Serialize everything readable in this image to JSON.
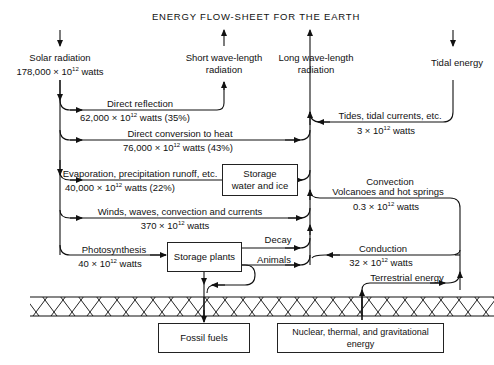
{
  "title": "ENERGY FLOW-SHEET FOR THE EARTH",
  "sources": {
    "solar": {
      "label": "Solar radiation",
      "value": "178,000 × 10",
      "exp": "12",
      "unit": " watts"
    },
    "tidal": {
      "label": "Tidal energy"
    },
    "terrestrial": {
      "label": "Terrestrial energy"
    }
  },
  "sinks": {
    "short_wave": {
      "line1": "Short wave-length",
      "line2": "radiation"
    },
    "long_wave": {
      "line1": "Long wave-length",
      "line2": "radiation"
    }
  },
  "flows": [
    {
      "id": "direct-reflection",
      "label": "Direct reflection",
      "value": "62,000 × 10",
      "exp": "12",
      "unit": " watts (35%)"
    },
    {
      "id": "direct-conversion",
      "label": "Direct conversion to heat",
      "value": "76,000 × 10",
      "exp": "12",
      "unit": " watts (43%)"
    },
    {
      "id": "evaporation",
      "label": "Evaporation, precipitation  runoff, etc.",
      "value": "40,000 × 10",
      "exp": "12",
      "unit": " watts (22%)"
    },
    {
      "id": "winds",
      "label": "Winds, waves, convection and currents",
      "value": "370 × 10",
      "exp": "12",
      "unit": " watts"
    },
    {
      "id": "photosynthesis",
      "label": "Photosynthesis",
      "value": "40 × 10",
      "exp": "12",
      "unit": " watts"
    },
    {
      "id": "tides",
      "label": "Tides, tidal currents, etc.",
      "value": "3 × 10",
      "exp": "12",
      "unit": " watts"
    },
    {
      "id": "convection",
      "label": "Convection",
      "label2": "Volcanoes and hot springs",
      "value": "0.3 × 10",
      "exp": "12",
      "unit": " watts"
    },
    {
      "id": "conduction",
      "label": "Conduction",
      "value": "32 × 10",
      "exp": "12",
      "unit": " watts"
    },
    {
      "id": "decay",
      "label": "Decay"
    },
    {
      "id": "animals",
      "label": "Animals"
    }
  ],
  "boxes": {
    "storage_water": {
      "line1": "Storage",
      "line2": "water and ice"
    },
    "storage_plants": {
      "label": "Storage plants"
    },
    "fossil_fuels": {
      "label": "Fossil fuels"
    },
    "nuclear": {
      "label": "Nuclear, thermal, and gravitational energy"
    }
  }
}
